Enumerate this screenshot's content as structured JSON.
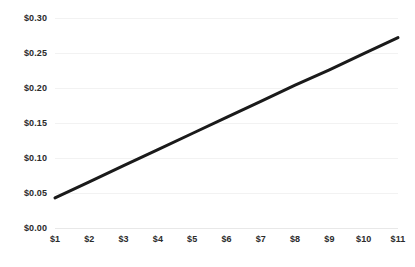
{
  "chart_data": {
    "type": "line",
    "title": "",
    "subtitle": "",
    "xlabel": "",
    "ylabel": "",
    "x": [
      1,
      2,
      3,
      4,
      5,
      6,
      7,
      8,
      9,
      10,
      11
    ],
    "categories": [
      "$1",
      "$2",
      "$3",
      "$4",
      "$5",
      "$6",
      "$7",
      "$8",
      "$9",
      "$10",
      "$11"
    ],
    "series": [
      {
        "name": "",
        "values": [
          0.043,
          0.066,
          0.089,
          0.112,
          0.135,
          0.158,
          0.181,
          0.204,
          0.226,
          0.249,
          0.272
        ],
        "color": "#1a1a1a",
        "line_width": 3
      }
    ],
    "xlim": [
      1,
      11
    ],
    "ylim": [
      0.0,
      0.3
    ],
    "y_ticks": [
      0.0,
      0.05,
      0.1,
      0.15,
      0.2,
      0.25,
      0.3
    ],
    "y_tick_labels": [
      "$0.00",
      "$0.05",
      "$0.10",
      "$0.15",
      "$0.20",
      "$0.25",
      "$0.30"
    ],
    "x_tick_labels": [
      "$1",
      "$2",
      "$3",
      "$4",
      "$5",
      "$6",
      "$7",
      "$8",
      "$9",
      "$10",
      "$11"
    ],
    "grid": true,
    "grid_axis": "y",
    "grid_color": "#f2f2f2",
    "legend": false,
    "legend_position": "none",
    "background_color": "#ffffff",
    "tick_label_color": "#2b2b2b",
    "annotations": []
  }
}
